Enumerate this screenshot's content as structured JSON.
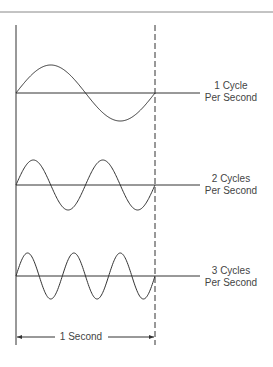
{
  "diagram": {
    "type": "frequency-illustration",
    "time_span_label": "1 Second",
    "waves": [
      {
        "cycles": 1,
        "label_line1": "1 Cycle",
        "label_line2": "Per Second",
        "baseline_y": 93,
        "amplitude": 28
      },
      {
        "cycles": 2,
        "label_line1": "2 Cycles",
        "label_line2": "Per Second",
        "baseline_y": 185,
        "amplitude": 25
      },
      {
        "cycles": 3,
        "label_line1": "3 Cycles",
        "label_line2": "Per Second",
        "baseline_y": 276,
        "amplitude": 23
      }
    ],
    "colors": {
      "line": "#333333",
      "rule": "#888888",
      "text": "#444444"
    }
  }
}
